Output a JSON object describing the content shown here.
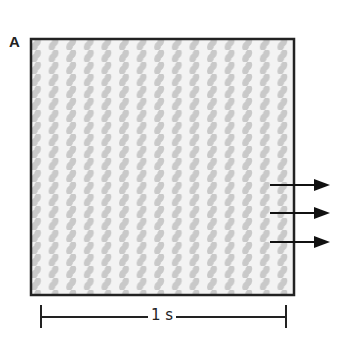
{
  "panel": {
    "label": "A"
  },
  "figure": {
    "stripe_count": 15,
    "stripe_color": "#c8c8c8",
    "background_color": "#f2f2f2",
    "border_color": "#222222",
    "arrows": {
      "count": 3,
      "direction": "right"
    }
  },
  "scale_bar": {
    "label": "1 s"
  }
}
